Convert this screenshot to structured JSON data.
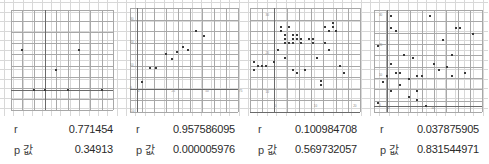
{
  "panels": [
    {
      "id": "panel-1",
      "stats": {
        "r_label": "r",
        "r_value": "0.771454",
        "p_label": "p 값",
        "p_value": "0.34913"
      },
      "chart_data": {
        "type": "scatter",
        "title": "",
        "xlabel": "",
        "ylabel": "",
        "grid": true,
        "legend": null,
        "xlim": [
          -3,
          6
        ],
        "ylim": [
          -1,
          4
        ],
        "x": [
          -2,
          -1,
          0,
          1,
          2,
          3,
          5
        ],
        "y": [
          2,
          0,
          0,
          1,
          0,
          2,
          0
        ],
        "r": 0.771454,
        "p_value": 0.34913
      }
    },
    {
      "id": "panel-2",
      "stats": {
        "r_label": "r",
        "r_value": "0.957586095",
        "p_label": "p 값",
        "p_value": "0.000005976"
      },
      "chart_data": {
        "type": "scatter",
        "title": "",
        "xlabel": "",
        "ylabel": "",
        "grid": true,
        "legend": null,
        "xlim": [
          -5,
          75
        ],
        "ylim": [
          -10,
          35
        ],
        "xticks": [
          0,
          25,
          50,
          75
        ],
        "yticks": [
          -10,
          0,
          10,
          20,
          30
        ],
        "x": [
          4,
          10,
          14,
          22,
          26,
          30,
          34,
          38,
          44,
          50
        ],
        "y": [
          3,
          9,
          9,
          15,
          13,
          16,
          18,
          17,
          25,
          23
        ],
        "r": 0.957586095,
        "p_value": 5.976e-06
      }
    },
    {
      "id": "panel-3",
      "stats": {
        "r_label": "r",
        "r_value": "0.100984708",
        "p_label": "p 값",
        "p_value": "0.569732057"
      },
      "chart_data": {
        "type": "scatter",
        "title": "",
        "xlabel": "",
        "ylabel": "",
        "grid": true,
        "legend": null,
        "xlim": [
          -6,
          22
        ],
        "ylim": [
          5,
          32
        ],
        "xticks": [
          0,
          10,
          20
        ],
        "yticks": [
          10,
          20,
          30
        ],
        "x": [
          -5,
          -5,
          -4,
          -3,
          -2,
          0,
          1,
          2,
          2,
          3,
          3,
          3,
          3,
          4,
          4,
          5,
          5,
          5,
          5,
          6,
          6,
          6,
          7,
          7,
          8,
          9,
          10,
          10,
          11,
          12,
          12,
          13,
          13,
          14,
          14,
          15,
          15,
          16,
          17,
          18
        ],
        "y": [
          18,
          16,
          17,
          17,
          17,
          18,
          21,
          26,
          27,
          25,
          24,
          23,
          19,
          27,
          23,
          25,
          24,
          23,
          16,
          25,
          24,
          15,
          24,
          23,
          16,
          24,
          24,
          23,
          19,
          13,
          12,
          27,
          23,
          26,
          21,
          28,
          27,
          26,
          17,
          15
        ],
        "r": 0.100984708,
        "p_value": 0.569732057
      }
    },
    {
      "id": "panel-4",
      "stats": {
        "r_label": "r",
        "r_value": "0.037875905",
        "p_label": "p 값",
        "p_value": "0.831544971"
      },
      "chart_data": {
        "type": "scatter",
        "title": "",
        "xlabel": "",
        "ylabel": "",
        "grid": true,
        "legend": null,
        "xlim": [
          -3,
          22
        ],
        "ylim": [
          -2,
          32
        ],
        "xticks": [
          0,
          10
        ],
        "yticks": [
          0,
          10,
          20,
          30
        ],
        "x": [
          -2,
          -2,
          -1,
          0,
          1,
          1,
          1,
          1,
          2,
          2,
          3,
          3,
          4,
          5,
          5,
          6,
          7,
          7,
          7,
          8,
          8,
          9,
          10,
          10,
          11,
          12,
          13,
          14,
          15,
          15,
          16,
          17,
          18,
          20
        ],
        "y": [
          20,
          1,
          8,
          10,
          30,
          26,
          14,
          5,
          25,
          11,
          11,
          7,
          17,
          9,
          3,
          16,
          10,
          5,
          2,
          10,
          10,
          0,
          30,
          30,
          14,
          12,
          22,
          13,
          17,
          10,
          26,
          26,
          11,
          24
        ],
        "r": 0.037875905,
        "p_value": 0.831544971
      }
    }
  ]
}
